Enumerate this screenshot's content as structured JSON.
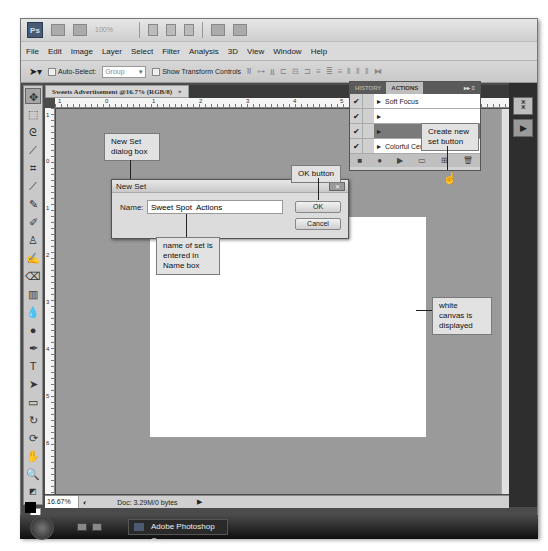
{
  "app": {
    "logo": "Ps",
    "zoom_select": "100%",
    "menu": [
      "File",
      "Edit",
      "Image",
      "Layer",
      "Select",
      "Filter",
      "Analysis",
      "3D",
      "View",
      "Window",
      "Help"
    ]
  },
  "options_bar": {
    "auto_select_label": "Auto-Select:",
    "auto_select_value": "Group",
    "show_transform_label": "Show Transform Controls"
  },
  "document": {
    "tab_title": "Sweets Advertisement @16.7% (RGB/8)",
    "tab_close": "×",
    "ruler_h": [
      "1",
      "0",
      "1",
      "2",
      "3",
      "4",
      "5"
    ],
    "ruler_v": [
      "1",
      "0",
      "1",
      "2",
      "3",
      "4",
      "5",
      "6"
    ],
    "zoom_status": "16.67%",
    "doc_status": "Doc: 3.29M/0 bytes"
  },
  "actions_panel": {
    "tabs": [
      "HISTORY",
      "ACTIONS"
    ],
    "active_tab": "ACTIONS",
    "items": [
      {
        "name": "Soft Focus",
        "checked": "✔"
      },
      {
        "name": "",
        "checked": "✔"
      },
      {
        "name": "",
        "checked": "✔"
      },
      {
        "name": "Colorful Center (color)",
        "checked": "✔"
      }
    ],
    "footer_icons": [
      "stop-icon",
      "record-icon",
      "play-icon",
      "new-set-icon",
      "new-action-icon",
      "delete-icon"
    ]
  },
  "dialog": {
    "title": "New Set",
    "name_label": "Name:",
    "name_value": "Sweet Spot  Actions",
    "ok_label": "OK",
    "cancel_label": "Cancel",
    "close_label": "✕"
  },
  "callouts": {
    "new_set_dialog": "New Set dialog box",
    "ok_button": "OK button",
    "create_new_set": "Create new set button",
    "name_of_set": "name of set is entered in Name box",
    "white_canvas": "white canvas is displayed"
  },
  "taskbar": {
    "app_label": "Adobe Photoshop C..."
  }
}
